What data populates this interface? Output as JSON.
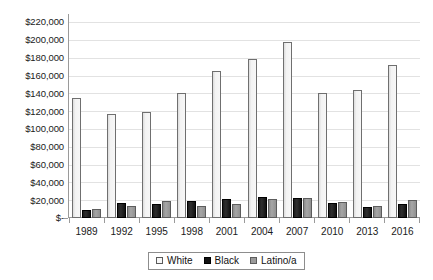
{
  "chart_data": {
    "type": "bar",
    "title": "",
    "subtitle": "",
    "xlabel": "",
    "ylabel": "",
    "categories": [
      "1989",
      "1992",
      "1995",
      "1998",
      "2001",
      "2004",
      "2007",
      "2010",
      "2013",
      "2016"
    ],
    "series": [
      {
        "name": "White",
        "color": "#f3f3f3",
        "values": [
          135000,
          117000,
          120000,
          141000,
          166000,
          179000,
          198000,
          141000,
          144000,
          172000
        ]
      },
      {
        "name": "Black",
        "color": "#121212",
        "values": [
          9000,
          17000,
          16000,
          19000,
          22000,
          24000,
          23000,
          17000,
          12000,
          16000
        ]
      },
      {
        "name": "Latino/a",
        "color": "#9a9a9a",
        "values": [
          10000,
          13000,
          19000,
          14000,
          16000,
          21000,
          23000,
          18000,
          14000,
          20000
        ]
      }
    ],
    "ylim": [
      0,
      230000
    ],
    "y_ticks": [
      0,
      20000,
      40000,
      60000,
      80000,
      100000,
      120000,
      140000,
      160000,
      180000,
      200000,
      220000
    ],
    "y_tick_labels": [
      "$-",
      "$20,000",
      "$40,000",
      "$60,000",
      "$80,000",
      "$100,000",
      "$120,000",
      "$140,000",
      "$160,000",
      "$180,000",
      "$200,000",
      "$220,000"
    ],
    "grid": true,
    "grid_axis": "y",
    "legend_position": "bottom",
    "legend_entries": [
      "White",
      "Black",
      "Latino/a"
    ]
  }
}
